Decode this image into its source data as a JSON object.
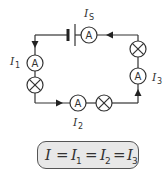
{
  "diagram": {
    "type": "series-circuit",
    "components": {
      "battery": {
        "label": "battery"
      },
      "ammeters": [
        {
          "id": "top",
          "symbol": "A",
          "current_label": "I",
          "current_sub": "S"
        },
        {
          "id": "left",
          "symbol": "A",
          "current_label": "I",
          "current_sub": "1"
        },
        {
          "id": "bottom",
          "symbol": "A",
          "current_label": "I",
          "current_sub": "2"
        },
        {
          "id": "right",
          "symbol": "A",
          "current_label": "I",
          "current_sub": "3"
        }
      ],
      "lamps": [
        {
          "id": "left"
        },
        {
          "id": "bottom"
        },
        {
          "id": "right"
        }
      ]
    },
    "labels": {
      "is_main": "I",
      "is_sub": "S",
      "i1_main": "I",
      "i1_sub": "1",
      "i2_main": "I",
      "i2_sub": "2",
      "i3_main": "I",
      "i3_sub": "3",
      "ammeter_symbol": "A"
    },
    "equation": {
      "text": "I = I1 = I2 = I3",
      "parts": [
        "I",
        "=",
        "I",
        "1",
        "=",
        "I",
        "2",
        "=",
        "I",
        "3"
      ]
    },
    "colors": {
      "line": "#333333",
      "box_fill": "#e8e8e8",
      "box_border": "#555555"
    }
  }
}
